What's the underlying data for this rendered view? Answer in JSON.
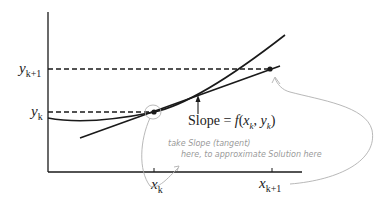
{
  "diagram": {
    "type": "euler-method-illustration",
    "colors": {
      "ink": "#1a1a1a",
      "annotation": "#9a9a9a",
      "background": "#ffffff"
    },
    "y_labels": {
      "y_k1_base": "y",
      "y_k1_sub": "k+1",
      "y_k_base": "y",
      "y_k_sub": "k"
    },
    "x_labels": {
      "x_k_base": "x",
      "x_k_sub": "k",
      "x_k1_base": "x",
      "x_k1_sub": "k+1"
    },
    "slope_label": {
      "prefix": "Slope = ",
      "func": "f",
      "open": "(",
      "x_base": "x",
      "x_sub": "k",
      "sep": ",  ",
      "y_base": "y",
      "y_sub": "k",
      "close": ")"
    },
    "annotation": {
      "line1": "take Slope (tangent)",
      "line2": "here, to approximate Solution here"
    },
    "elements": {
      "curve": "solution-curve",
      "tangent": "tangent-line",
      "dashed_lines": [
        "y_k",
        "y_k+1"
      ],
      "points": [
        "(x_k, y_k)",
        "(x_k+1, y_k+1)"
      ]
    }
  }
}
